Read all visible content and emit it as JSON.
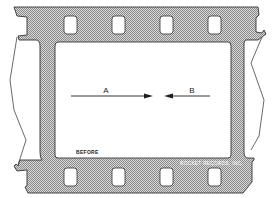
{
  "diagram": {
    "arrows": [
      {
        "label": "A",
        "direction": "right"
      },
      {
        "label": "B",
        "direction": "left"
      }
    ],
    "caption": "BEFORE",
    "credit": "ROCKET RECORDS, INC.",
    "colors": {
      "film": "#b9b9b9",
      "outline": "#333333",
      "frame": "#ffffff",
      "ink": "#1e1e1e"
    }
  }
}
